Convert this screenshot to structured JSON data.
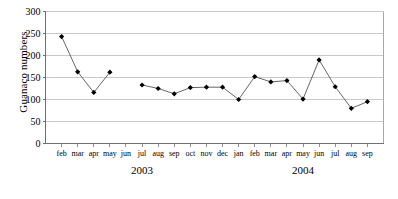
{
  "chart_data": {
    "type": "line",
    "title": "",
    "xlabel": "",
    "ylabel": "Guanaco numbers",
    "ylim": [
      0,
      300
    ],
    "yticks": [
      0,
      50,
      100,
      150,
      200,
      250,
      300
    ],
    "ytick_labels": [
      "0",
      "50",
      "100",
      "150",
      "200",
      "250",
      "300"
    ],
    "grid": "horizontal",
    "legend": "none",
    "marker": "filled-diamond",
    "line_color": "#555555",
    "marker_color": "#000000",
    "grid_color": "#c8c8c8",
    "axis_color": "#808080",
    "background": "#ffffff",
    "categories": [
      "feb",
      "mar",
      "apr",
      "may",
      "jun",
      "jul",
      "aug",
      "sep",
      "oct",
      "nov",
      "dec",
      "jan",
      "feb",
      "mar",
      "apr",
      "may",
      "jun",
      "jul",
      "aug",
      "sep"
    ],
    "values": [
      243,
      163,
      116,
      162,
      null,
      133,
      125,
      113,
      127,
      128,
      128,
      100,
      152,
      140,
      143,
      101,
      190,
      129,
      80,
      95
    ],
    "group_labels": [
      {
        "text": "2003",
        "start_index": 0,
        "end_index": 10
      },
      {
        "text": "2004",
        "start_index": 11,
        "end_index": 19
      }
    ]
  }
}
